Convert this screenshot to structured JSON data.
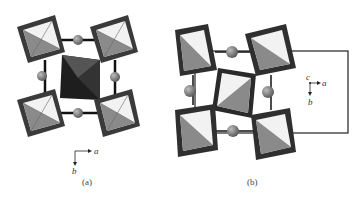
{
  "figure": {
    "panels": [
      {
        "id": "a",
        "caption": "(a)",
        "axes": {
          "horizontal": "a",
          "vertical": "b"
        },
        "description": "Octahedral framework viewed along c; corner octahedra light/grey, central octahedron dark"
      },
      {
        "id": "b",
        "caption": "(b)",
        "axes": {
          "out_of_plane": "c",
          "horizontal": "a",
          "vertical": "b"
        },
        "description": "Tilted octahedral framework with unit cell outline and interstitial cations"
      }
    ],
    "colors": {
      "octahedron_rim": "#3a3a3a",
      "face_light": "#f2f2f2",
      "face_mid": "#8a8a8a",
      "face_dark": "#2a2a2a",
      "sphere": "#7a7a7a",
      "bond": "#111111",
      "cell": "#222222"
    }
  }
}
